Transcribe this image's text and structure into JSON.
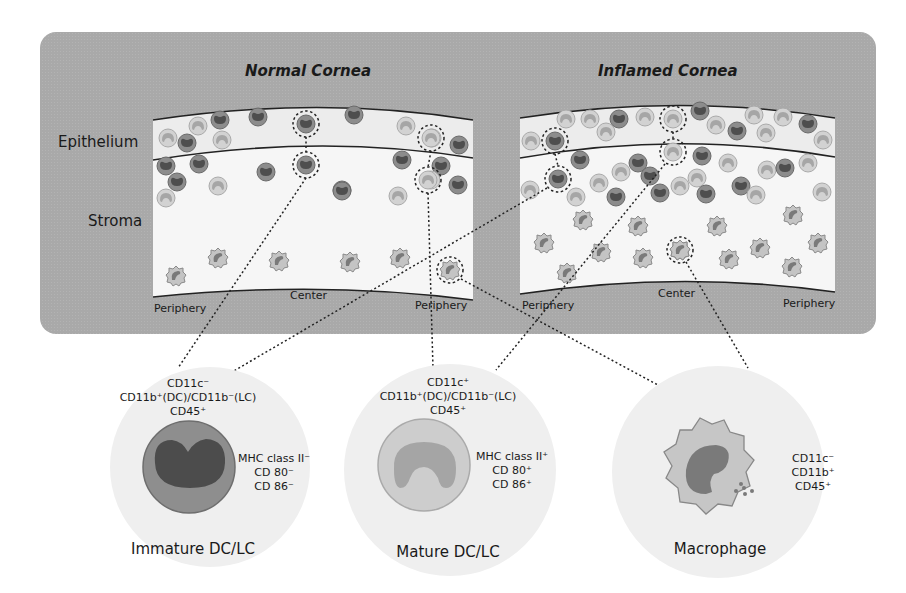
{
  "panels": {
    "normal": {
      "title": "Normal Cornea",
      "labels": {
        "left": "Periphery",
        "center": "Center",
        "right": "Periphery"
      }
    },
    "inflamed": {
      "title": "Inflamed Cornea",
      "labels": {
        "left": "Periphery",
        "center": "Center",
        "right": "Periphery"
      }
    }
  },
  "layers": {
    "epithelium": "Epithelium",
    "stroma": "Stroma"
  },
  "cell_types": [
    {
      "name": "Immature DC/LC",
      "markers_top": [
        "CD11c⁻",
        "CD11b⁺(DC)/CD11b⁻(LC)",
        "CD45⁺"
      ],
      "markers_side": [
        "MHC class II⁻",
        "CD 80⁻",
        "CD 86⁻"
      ]
    },
    {
      "name": "Mature DC/LC",
      "markers_top": [
        "CD11c⁺",
        "CD11b⁺(DC)/CD11b⁻(LC)",
        "CD45⁺"
      ],
      "markers_side": [
        "MHC class II⁺",
        "CD 80⁺",
        "CD 86⁺"
      ]
    },
    {
      "name": "Macrophage",
      "markers_top": [],
      "markers_side": [
        "CD11c⁻",
        "CD11b⁺",
        "CD45⁺"
      ]
    }
  ],
  "colors": {
    "panel_bg": "#a9a9a9",
    "tissue": "#f4f4f4",
    "epithelium": "#ececec",
    "immature_cell": "#8a8a8a",
    "immature_nucleus": "#555555",
    "mature_cell": "#c6c6c6",
    "mature_nucleus": "#9a9a9a",
    "macrophage": "#bdbdbd",
    "macrophage_nucleus": "#7a7a7a",
    "halo": "#ebebeb"
  }
}
